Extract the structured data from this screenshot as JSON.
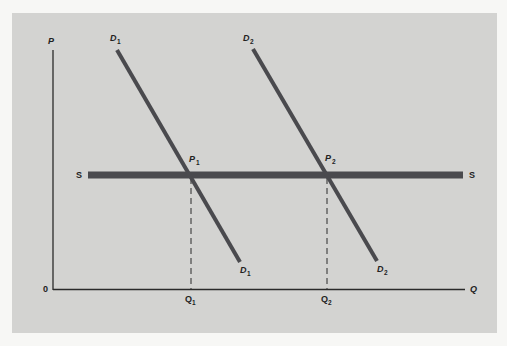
{
  "diagram": {
    "type": "supply-demand",
    "axes": {
      "y_label": "P",
      "x_label": "Q",
      "origin_label": "0"
    },
    "curves": [
      {
        "id": "S",
        "label_left": "S",
        "label_right": "S",
        "kind": "horizontal-supply"
      },
      {
        "id": "D1",
        "label_top": "D",
        "label_top_sub": "1",
        "label_bottom": "D",
        "label_bottom_sub": "1"
      },
      {
        "id": "D2",
        "label_top": "D",
        "label_top_sub": "2",
        "label_bottom": "D",
        "label_bottom_sub": "2"
      }
    ],
    "equilibria": [
      {
        "price_label": "P",
        "price_sub": "1",
        "quantity_label": "Q",
        "quantity_sub": "1"
      },
      {
        "price_label": "P",
        "price_sub": "2",
        "quantity_label": "Q",
        "quantity_sub": "2"
      }
    ],
    "colors": {
      "panel_bg": "#d3d3d1",
      "page_bg": "#f7f7f5",
      "curve": "#4a4a4e",
      "axis": "#2a2a2a"
    }
  }
}
